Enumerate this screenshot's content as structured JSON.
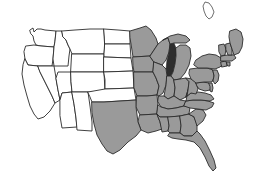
{
  "map": {
    "title": "United States Map",
    "description": "Outline map of the contiguous United States with eastern and southern states filled in gray and western states left white",
    "projection_note": "contiguous-48",
    "colors": {
      "background": "#ffffff",
      "shaded_fill": "#9a9a9a",
      "unshaded_fill": "#ffffff",
      "border_stroke": "#2b2b2b",
      "water_fill": "#2e2e2e"
    },
    "legend": {
      "shaded_label": "Shaded state",
      "unshaded_label": "Unshaded state",
      "water_label": "Lake Michigan"
    },
    "counts": {
      "shaded_states": 27,
      "unshaded_states": 21,
      "total_states": 48
    },
    "water_features": [
      {
        "name": "Lake Michigan",
        "fill": "#2e2e2e"
      }
    ],
    "neighbor_outlines": [
      {
        "name": "canada-boundary-fragment"
      }
    ],
    "states": [
      {
        "code": "WA",
        "name": "Washington",
        "shaded": false
      },
      {
        "code": "OR",
        "name": "Oregon",
        "shaded": false
      },
      {
        "code": "CA",
        "name": "California",
        "shaded": false
      },
      {
        "code": "NV",
        "name": "Nevada",
        "shaded": false
      },
      {
        "code": "ID",
        "name": "Idaho",
        "shaded": false
      },
      {
        "code": "MT",
        "name": "Montana",
        "shaded": false
      },
      {
        "code": "WY",
        "name": "Wyoming",
        "shaded": false
      },
      {
        "code": "UT",
        "name": "Utah",
        "shaded": false
      },
      {
        "code": "AZ",
        "name": "Arizona",
        "shaded": false
      },
      {
        "code": "CO",
        "name": "Colorado",
        "shaded": false
      },
      {
        "code": "NM",
        "name": "New Mexico",
        "shaded": false
      },
      {
        "code": "ND",
        "name": "North Dakota",
        "shaded": false
      },
      {
        "code": "SD",
        "name": "South Dakota",
        "shaded": false
      },
      {
        "code": "NE",
        "name": "Nebraska",
        "shaded": false
      },
      {
        "code": "KS",
        "name": "Kansas",
        "shaded": false
      },
      {
        "code": "OK",
        "name": "Oklahoma",
        "shaded": false
      },
      {
        "code": "MN",
        "name": "Minnesota",
        "shaded": true
      },
      {
        "code": "IA",
        "name": "Iowa",
        "shaded": true
      },
      {
        "code": "MO",
        "name": "Missouri",
        "shaded": true
      },
      {
        "code": "AR",
        "name": "Arkansas",
        "shaded": true
      },
      {
        "code": "LA",
        "name": "Louisiana",
        "shaded": true
      },
      {
        "code": "TX",
        "name": "Texas",
        "shaded": true
      },
      {
        "code": "WI",
        "name": "Wisconsin",
        "shaded": true
      },
      {
        "code": "IL",
        "name": "Illinois",
        "shaded": true
      },
      {
        "code": "MI",
        "name": "Michigan",
        "shaded": true
      },
      {
        "code": "IN",
        "name": "Indiana",
        "shaded": true
      },
      {
        "code": "OH",
        "name": "Ohio",
        "shaded": true
      },
      {
        "code": "KY",
        "name": "Kentucky",
        "shaded": true
      },
      {
        "code": "TN",
        "name": "Tennessee",
        "shaded": true
      },
      {
        "code": "MS",
        "name": "Mississippi",
        "shaded": true
      },
      {
        "code": "AL",
        "name": "Alabama",
        "shaded": true
      },
      {
        "code": "GA",
        "name": "Georgia",
        "shaded": true
      },
      {
        "code": "FL",
        "name": "Florida",
        "shaded": true
      },
      {
        "code": "SC",
        "name": "South Carolina",
        "shaded": true
      },
      {
        "code": "NC",
        "name": "North Carolina",
        "shaded": true
      },
      {
        "code": "VA",
        "name": "Virginia",
        "shaded": true
      },
      {
        "code": "WV",
        "name": "West Virginia",
        "shaded": true
      },
      {
        "code": "MD",
        "name": "Maryland",
        "shaded": true
      },
      {
        "code": "DE",
        "name": "Delaware",
        "shaded": true
      },
      {
        "code": "PA",
        "name": "Pennsylvania",
        "shaded": true
      },
      {
        "code": "NJ",
        "name": "New Jersey",
        "shaded": true
      },
      {
        "code": "NY",
        "name": "New York",
        "shaded": true
      },
      {
        "code": "CT",
        "name": "Connecticut",
        "shaded": true
      },
      {
        "code": "RI",
        "name": "Rhode Island",
        "shaded": true
      },
      {
        "code": "MA",
        "name": "Massachusetts",
        "shaded": true
      },
      {
        "code": "VT",
        "name": "Vermont",
        "shaded": true
      },
      {
        "code": "NH",
        "name": "New Hampshire",
        "shaded": true
      },
      {
        "code": "ME",
        "name": "Maine",
        "shaded": true
      }
    ]
  }
}
